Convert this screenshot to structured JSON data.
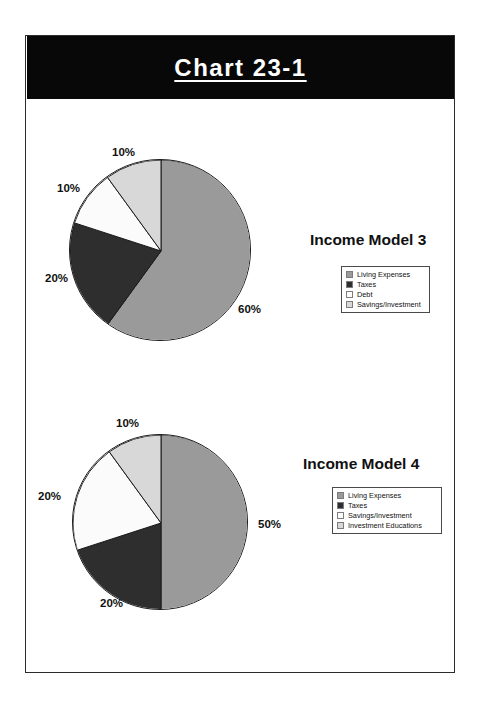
{
  "page": {
    "title": "Chart 23-1"
  },
  "colors": {
    "banner_bg": "#080808",
    "banner_text": "#ffffff",
    "living_expenses": "#9a9a9a",
    "taxes": "#2e2e2e",
    "debt": "#efefef",
    "savings_investment": "#e4e4e4",
    "investment_educations": "#cfcfcf",
    "slice_outline": "#1a1a1a",
    "page_border": "#2b2b2b"
  },
  "charts": [
    {
      "id": "income-model-3",
      "title": "Income Model 3",
      "legend": [
        {
          "label": "Living Expenses",
          "color": "#9a9a9a"
        },
        {
          "label": "Taxes",
          "color": "#2e2e2e"
        },
        {
          "label": "Debt",
          "color": "#fbfbfb"
        },
        {
          "label": "Savings/Investment",
          "color": "#d8d8d8"
        }
      ],
      "labels": [
        {
          "text": "60%",
          "x": 238,
          "y": 303
        },
        {
          "text": "20%",
          "x": 45,
          "y": 272
        },
        {
          "text": "10%",
          "x": 57,
          "y": 182
        },
        {
          "text": "10%",
          "x": 112,
          "y": 146
        }
      ]
    },
    {
      "id": "income-model-4",
      "title": "Income Model 4",
      "legend": [
        {
          "label": "Living Expenses",
          "color": "#9a9a9a"
        },
        {
          "label": "Taxes",
          "color": "#2e2e2e"
        },
        {
          "label": "Savings/Investment",
          "color": "#fbfbfb"
        },
        {
          "label": "Investment Educations",
          "color": "#d8d8d8"
        }
      ],
      "labels": [
        {
          "text": "50%",
          "x": 258,
          "y": 518
        },
        {
          "text": "20%",
          "x": 38,
          "y": 490
        },
        {
          "text": "20%",
          "x": 100,
          "y": 597
        },
        {
          "text": "10%",
          "x": 116,
          "y": 417
        }
      ]
    }
  ],
  "chart_data": [
    {
      "type": "pie",
      "title": "Income Model 3",
      "categories": [
        "Living Expenses",
        "Taxes",
        "Debt",
        "Savings/Investment"
      ],
      "values": [
        60,
        20,
        10,
        10
      ],
      "value_labels": [
        "60%",
        "20%",
        "10%",
        "10%"
      ],
      "unit": "percent",
      "colors": [
        "#9a9a9a",
        "#2e2e2e",
        "#fbfbfb",
        "#d8d8d8"
      ],
      "start_angle_deg": 0,
      "direction": "clockwise",
      "legend_position": "right",
      "xlabel": "",
      "ylabel": ""
    },
    {
      "type": "pie",
      "title": "Income Model 4",
      "categories": [
        "Living Expenses",
        "Taxes",
        "Savings/Investment",
        "Investment Educations"
      ],
      "values": [
        50,
        20,
        20,
        10
      ],
      "value_labels": [
        "50%",
        "20%",
        "20%",
        "10%"
      ],
      "unit": "percent",
      "colors": [
        "#9a9a9a",
        "#2e2e2e",
        "#fbfbfb",
        "#d8d8d8"
      ],
      "start_angle_deg": 0,
      "direction": "clockwise",
      "legend_position": "right",
      "xlabel": "",
      "ylabel": ""
    }
  ],
  "geometry": {
    "pie1": {
      "cx": 160,
      "cy": 250,
      "r": 91
    },
    "pie2": {
      "cx": 160,
      "cy": 522,
      "r": 88
    }
  }
}
